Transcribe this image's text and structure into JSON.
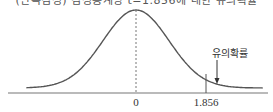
{
  "chart_data": {
    "type": "line",
    "title": "(단측검정) 검정통계량 t=1.856에 대한 유의확률",
    "xlabel": "",
    "ylabel": "",
    "distribution": "t-density (bell curve)",
    "x_range": [
      -4,
      4
    ],
    "center": 0,
    "critical_value": 1.856,
    "tick_labels": [
      "0",
      "1.856"
    ],
    "tick_values": [
      0,
      1.856
    ],
    "annotations": [
      {
        "text": "유의확률",
        "points_to": "right tail area beyond 1.856"
      }
    ],
    "center_line_style": "dashed",
    "grid": false
  },
  "colors": {
    "curve": "#555555",
    "axis": "#777777",
    "text": "#333333"
  }
}
